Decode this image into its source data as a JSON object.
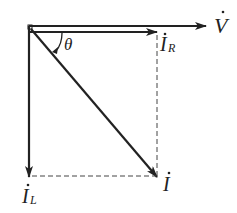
{
  "diagram": {
    "type": "phasor-diagram",
    "colors": {
      "line": "#222222",
      "dashed": "#444444",
      "background": "#ffffff"
    },
    "labels": {
      "voltage": {
        "main": "V",
        "dot": "·"
      },
      "current_r": {
        "main": "I",
        "sub": "R"
      },
      "current_l": {
        "main": "I",
        "sub": "L"
      },
      "current_total": {
        "main": "I"
      },
      "angle": "θ"
    },
    "vectors": [
      {
        "name": "V",
        "from": [
          29,
          26
        ],
        "to": [
          206,
          26
        ],
        "style": "solid"
      },
      {
        "name": "I_R",
        "from": [
          29,
          32
        ],
        "to": [
          157,
          32
        ],
        "style": "solid"
      },
      {
        "name": "I_L",
        "from": [
          29,
          26
        ],
        "to": [
          29,
          176
        ],
        "style": "solid"
      },
      {
        "name": "I",
        "from": [
          29,
          28
        ],
        "to": [
          157,
          176
        ],
        "style": "solid"
      }
    ],
    "projections": [
      {
        "from": [
          157,
          34
        ],
        "to": [
          157,
          176
        ],
        "style": "dashed"
      },
      {
        "from": [
          31,
          176
        ],
        "to": [
          157,
          176
        ],
        "style": "dashed"
      }
    ]
  }
}
